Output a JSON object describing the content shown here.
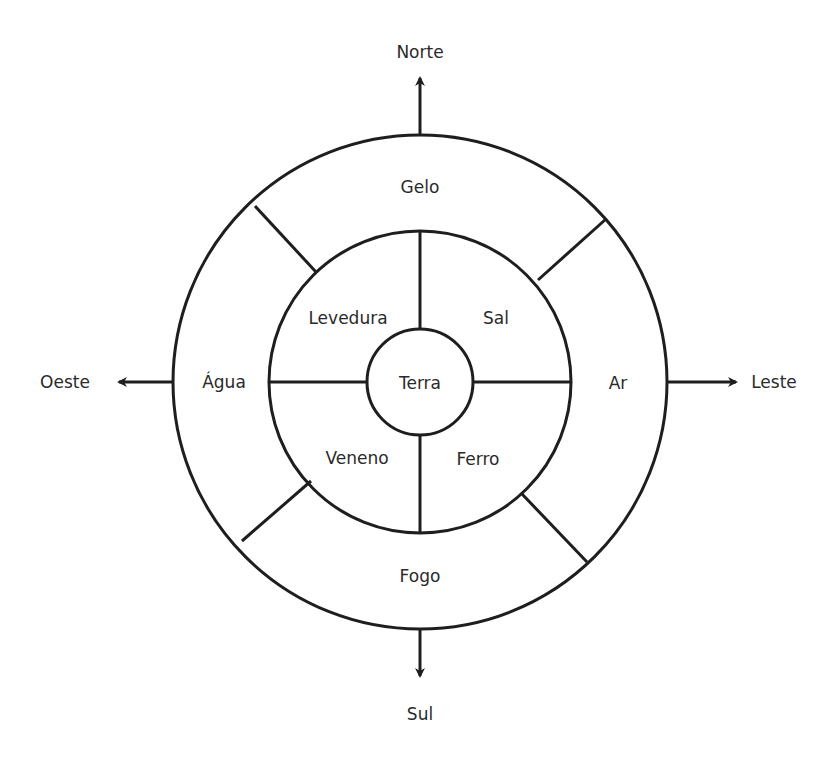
{
  "diagram": {
    "directions": {
      "north": "Norte",
      "south": "Sul",
      "east": "Leste",
      "west": "Oeste"
    },
    "center": {
      "label": "Terra"
    },
    "inner_ring": {
      "top_left": "Levedura",
      "top_right": "Sal",
      "bottom_left": "Veneno",
      "bottom_right": "Ferro"
    },
    "outer_ring": {
      "top": "Gelo",
      "right": "Ar",
      "bottom": "Fogo",
      "left": "Água"
    },
    "colors": {
      "stroke": "#1e1e1e",
      "text": "#2a2a2a",
      "background": "#ffffff"
    }
  }
}
